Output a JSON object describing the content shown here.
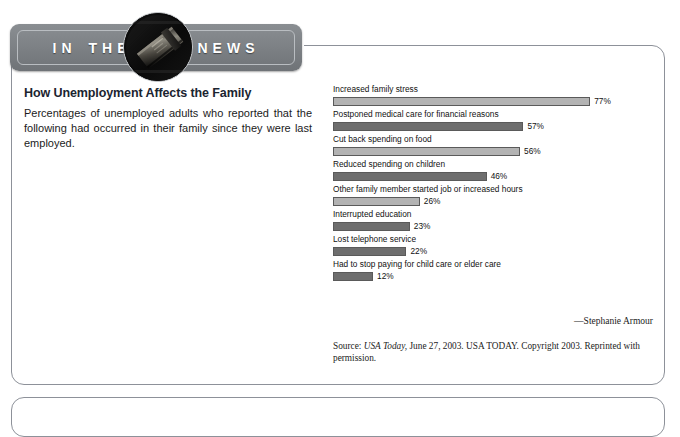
{
  "banner": {
    "word1": "IN",
    "word2": "THE",
    "word3": "NEWS",
    "badge_icon": "newspaper-photo-badge"
  },
  "article": {
    "headline": "How Unemployment Affects the Family",
    "deck": "Percentages of unemployed adults who reported that the following had occurred in their family since they were last employed.",
    "byline": "—Stephanie Armour",
    "source_prefix": "Source: ",
    "source_italic": "USA Today,",
    "source_rest": " June 27, 2003. USA TODAY. Copyright 2003. Reprinted with permission."
  },
  "chart_data": {
    "type": "bar",
    "orientation": "horizontal",
    "title": "How Unemployment Affects the Family",
    "xlabel": "",
    "ylabel": "",
    "xlim": [
      0,
      100
    ],
    "grid": false,
    "legend": "none",
    "value_suffix": "%",
    "categories": [
      "Increased family stress",
      "Postponed medical care for financial reasons",
      "Cut back spending on food",
      "Reduced spending on children",
      "Other family member started job or increased hours",
      "Interrupted education",
      "Lost telephone service",
      "Had to stop paying for child care or elder care"
    ],
    "values": [
      77,
      57,
      56,
      46,
      26,
      23,
      22,
      12
    ],
    "value_labels": [
      "77%",
      "57%",
      "56%",
      "46%",
      "26%",
      "23%",
      "22%",
      "12%"
    ],
    "bar_shades": [
      "light",
      "dark",
      "light",
      "dark",
      "light",
      "dark",
      "dark",
      "dark"
    ],
    "colors": {
      "light": "#b3b3b3",
      "dark": "#6e6e6e",
      "border": "#5a5a5a"
    },
    "px_per_percent": 3.34
  }
}
